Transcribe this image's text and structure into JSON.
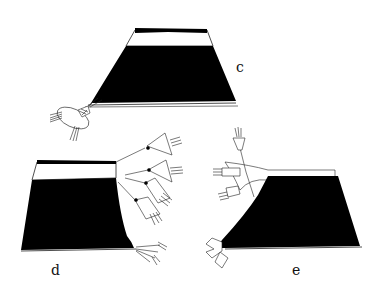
{
  "figure": {
    "panels": [
      {
        "id": "c",
        "label": "c",
        "description": "trapezoidal garment with dark body, light upper band, single tassel bundle at lower left"
      },
      {
        "id": "d",
        "label": "d",
        "description": "rectangular garment with dark body, light upper band, chain of four tassels on right and tassel bundle at lower right"
      },
      {
        "id": "e",
        "label": "e",
        "description": "flared garment with dark body, band of eight pendant motifs, three tassels on cords at upper left and bundle at lower left"
      }
    ],
    "colors": {
      "fill": "#000000",
      "background": "#ffffff",
      "line": "#222222"
    },
    "fringe_count_e": 8
  }
}
